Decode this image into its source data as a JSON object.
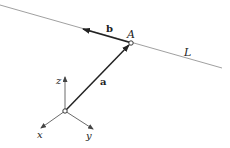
{
  "labels": {
    "point_A": "A",
    "line_L": "L",
    "vector_a": "a",
    "vector_b": "b",
    "axis_x": "x",
    "axis_y": "y",
    "axis_z": "z"
  },
  "colors": {
    "line": "#888888",
    "vector": "#222222",
    "text": "#222222"
  }
}
